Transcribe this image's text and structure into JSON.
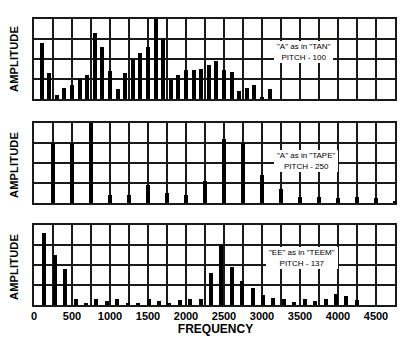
{
  "chart_data": [
    {
      "type": "bar",
      "title": "\"A\" as in \"TAN\"",
      "subtitle": "PITCH - 100",
      "xlabel": "FREQUENCY",
      "ylabel": "AMPLITUDE",
      "xlim": [
        0,
        4750
      ],
      "ylim": [
        0,
        100
      ],
      "grid": true,
      "pitch_hz": 100,
      "x": [
        100,
        200,
        300,
        400,
        500,
        600,
        700,
        800,
        900,
        1000,
        1100,
        1200,
        1300,
        1400,
        1500,
        1600,
        1700,
        1800,
        1900,
        2000,
        2100,
        2200,
        2300,
        2400,
        2500,
        2600,
        2700,
        2800,
        2900,
        3000,
        3100,
        3200
      ],
      "values": [
        70,
        32,
        5,
        14,
        18,
        25,
        30,
        83,
        65,
        35,
        12,
        32,
        50,
        58,
        65,
        100,
        75,
        24,
        30,
        36,
        36,
        38,
        42,
        48,
        36,
        34,
        10,
        14,
        18,
        3,
        12,
        0
      ]
    },
    {
      "type": "bar",
      "title": "\"A\" as in \"TAPE\"",
      "subtitle": "PITCH - 250",
      "xlabel": "FREQUENCY",
      "ylabel": "AMPLITUDE",
      "xlim": [
        0,
        4750
      ],
      "ylim": [
        0,
        100
      ],
      "grid": true,
      "pitch_hz": 250,
      "x": [
        250,
        500,
        750,
        1000,
        1250,
        1500,
        1750,
        2000,
        2250,
        2500,
        2750,
        3000,
        3250,
        3500,
        3750,
        4000,
        4250,
        4500,
        4750
      ],
      "values": [
        75,
        75,
        100,
        10,
        10,
        22,
        12,
        10,
        27,
        80,
        75,
        35,
        18,
        8,
        7,
        6,
        8,
        6,
        2
      ]
    },
    {
      "type": "bar",
      "title": "\"EE\" as in \"TEEM\"",
      "subtitle": "PITCH - 137",
      "xlabel": "FREQUENCY",
      "ylabel": "AMPLITUDE",
      "xlim": [
        0,
        4750
      ],
      "ylim": [
        0,
        100
      ],
      "grid": true,
      "pitch_hz": 137,
      "x": [
        137,
        274,
        411,
        548,
        685,
        822,
        959,
        1096,
        1233,
        1370,
        1507,
        1644,
        1781,
        1918,
        2055,
        2192,
        2329,
        2466,
        2603,
        2740,
        2877,
        3014,
        3151,
        3288,
        3425,
        3562,
        3699,
        3836,
        3973,
        4110,
        4247
      ],
      "values": [
        90,
        63,
        45,
        8,
        3,
        8,
        5,
        7,
        3,
        3,
        8,
        5,
        3,
        6,
        7,
        7,
        40,
        75,
        48,
        30,
        21,
        12,
        9,
        7,
        4,
        8,
        5,
        8,
        14,
        11,
        6
      ]
    }
  ],
  "panels": [
    {
      "ylabel": "AMPLITUDE",
      "annotation_line1": "\"A\" as in \"TAN\"",
      "annotation_line2": "PITCH - 100"
    },
    {
      "ylabel": "AMPLITUDE",
      "annotation_line1": "\"A\" as in \"TAPE\"",
      "annotation_line2": "PITCH - 250"
    },
    {
      "ylabel": "AMPLITUDE",
      "annotation_line1": "\"EE\" as in \"TEEM\"",
      "annotation_line2": "PITCH - 137"
    }
  ],
  "x_axis": {
    "label": "FREQUENCY",
    "ticks": [
      "0",
      "500",
      "1000",
      "1500",
      "2000",
      "2500",
      "3000",
      "3500",
      "4000",
      "4500"
    ],
    "tick_values": [
      0,
      500,
      1000,
      1500,
      2000,
      2500,
      3000,
      3500,
      4000,
      4500
    ]
  },
  "colors": {
    "bar": "#000000",
    "grid": "#1a1a1a",
    "background": "#ffffff"
  }
}
